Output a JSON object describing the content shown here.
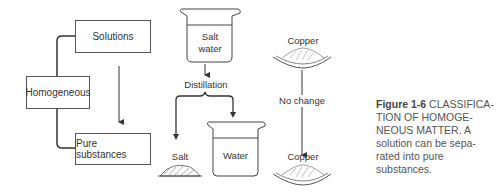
{
  "diagram": {
    "boxes": {
      "solutions": "Solutions",
      "homogeneous": "Homogeneous",
      "pure_substances": "Pure substances"
    },
    "beakers": {
      "salt_water": [
        "Salt",
        "water"
      ],
      "water": "Water"
    },
    "labels": {
      "distillation": "Distillation",
      "salt": "Salt",
      "copper_top": "Copper",
      "no_change": "No change",
      "copper_bottom": "Copper"
    }
  },
  "caption": {
    "figure_number": "Figure 1-6",
    "text": "CLASSIFICATION OF HOMOGENEOUS MATTER. A solution can be separated into pure substances.",
    "lines": [
      "CLASSIFICA-",
      "TION OF HOMOGE-",
      "NEOUS MATTER. A",
      "solution can be sepa-",
      "rated into pure",
      "substances."
    ]
  }
}
